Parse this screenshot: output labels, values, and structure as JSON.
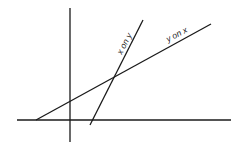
{
  "diagram": {
    "type": "regression-lines",
    "axes": {
      "x_axis": {
        "x1": 17,
        "y1": 120,
        "x2": 231,
        "y2": 120
      },
      "y_axis": {
        "x1": 70,
        "y1": 8,
        "x2": 70,
        "y2": 142
      }
    },
    "lines": [
      {
        "label": "x on y",
        "x1": 90,
        "y1": 125,
        "x2": 143,
        "y2": 20,
        "label_x": 127,
        "label_y": 45,
        "label_angle": -63
      },
      {
        "label": "y on x",
        "x1": 36,
        "y1": 120,
        "x2": 211,
        "y2": 24,
        "label_x": 178,
        "label_y": 37,
        "label_angle": -28
      }
    ],
    "intersection": {
      "x": 115,
      "y": 77
    }
  }
}
